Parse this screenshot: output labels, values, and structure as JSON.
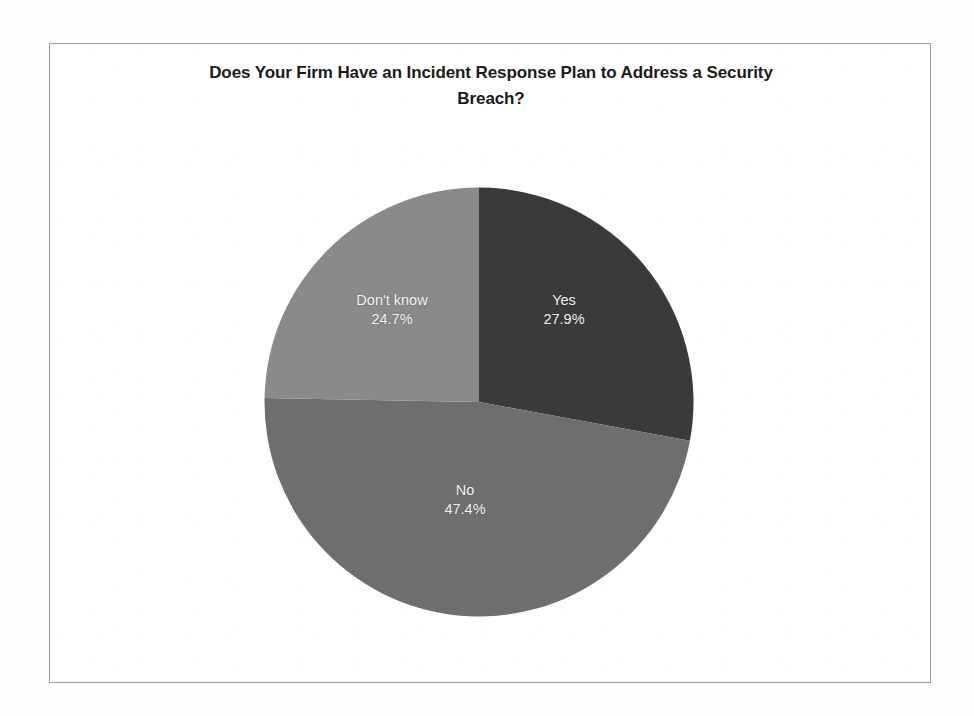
{
  "chart_data": {
    "type": "pie",
    "title": "Does Your Firm Have an Incident Response Plan to Address a Security Breach?",
    "categories": [
      "Yes",
      "No",
      "Don't know"
    ],
    "values": [
      27.9,
      47.4,
      24.7
    ],
    "value_unit": "percent",
    "labels": [
      "27.9%",
      "47.4%",
      "24.7%"
    ],
    "colors": [
      "#3a3a3a",
      "#6e6e6e",
      "#8a8a8a"
    ],
    "label_color": "#f2f2f2",
    "start_angle_deg": 0,
    "direction": "clockwise",
    "legend": "none",
    "grid": false,
    "slices": [
      {
        "name": "Yes",
        "value": 27.9,
        "label": "Yes",
        "pct_label": "27.9%",
        "color": "#3a3a3a"
      },
      {
        "name": "No",
        "value": 47.4,
        "label": "No",
        "pct_label": "47.4%",
        "color": "#6e6e6e"
      },
      {
        "name": "Don't know",
        "value": 24.7,
        "label": "Don't know",
        "pct_label": "24.7%",
        "color": "#8a8a8a"
      }
    ]
  },
  "frame": {
    "border_color": "#9a9a9a",
    "background": "#ffffff"
  }
}
